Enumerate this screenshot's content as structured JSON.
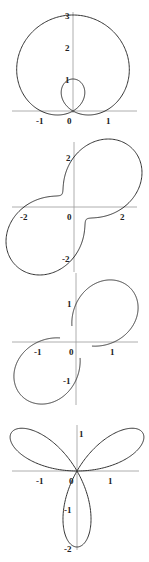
{
  "chart_data": [
    {
      "type": "line",
      "title": "",
      "description": "Polar curve: limacon with inner loop, r = 1 + 2 sin(theta)",
      "equation": "r = 1 + 2 sin(theta)",
      "origin_px": [
        73,
        111
      ],
      "unit_px": 32,
      "xlim": [
        -1.9,
        2.0
      ],
      "ylim": [
        -0.3,
        3.1
      ],
      "x_ticks": [
        {
          "value": -1,
          "label": "-1"
        },
        {
          "value": 0,
          "label": "0"
        },
        {
          "value": 1,
          "label": "1"
        }
      ],
      "y_ticks": [
        {
          "value": 1,
          "label": "1"
        },
        {
          "value": 2,
          "label": "2"
        },
        {
          "value": 3,
          "label": "3"
        }
      ],
      "grid": false
    },
    {
      "type": "line",
      "title": "",
      "description": "Polar curve: peanut-shaped curve elongated along y = x",
      "equation": "r = 2 + 1.3 sin(2 theta)",
      "origin_px": [
        74,
        207
      ],
      "unit_px": 25,
      "xlim": [
        -2.6,
        2.6
      ],
      "ylim": [
        -2.8,
        2.8
      ],
      "x_ticks": [
        {
          "value": -2,
          "label": "-2"
        },
        {
          "value": 0,
          "label": "0"
        },
        {
          "value": 2,
          "label": "2"
        }
      ],
      "y_ticks": [
        {
          "value": 2,
          "label": "2"
        },
        {
          "value": -2,
          "label": "-2"
        }
      ],
      "grid": false
    },
    {
      "type": "line",
      "title": "",
      "description": "Polar curve: two-petal curve with petals in quadrants I and III, passing through origin",
      "equation": "r = sin(theta) + cos(theta) + 0.6 sin(2 theta)",
      "origin_px": [
        76,
        342
      ],
      "unit_px": 38,
      "xlim": [
        -1.7,
        1.7
      ],
      "ylim": [
        -1.8,
        1.8
      ],
      "x_ticks": [
        {
          "value": -1,
          "label": "-1"
        },
        {
          "value": 0,
          "label": "0"
        },
        {
          "value": 1,
          "label": "1"
        }
      ],
      "y_ticks": [
        {
          "value": 1,
          "label": "1"
        },
        {
          "value": -1,
          "label": "-1"
        }
      ],
      "grid": false
    },
    {
      "type": "line",
      "title": "",
      "description": "Polar curve: three-petal rose",
      "equation": "r = 2 sin(3 theta)",
      "origin_px": [
        77,
        471
      ],
      "unit_px": 38,
      "xlim": [
        -1.9,
        1.9
      ],
      "ylim": [
        -2.1,
        1.4
      ],
      "x_ticks": [
        {
          "value": -1,
          "label": "-1"
        },
        {
          "value": 0,
          "label": "0"
        },
        {
          "value": 1,
          "label": "1"
        }
      ],
      "y_ticks": [
        {
          "value": 1,
          "label": "1"
        },
        {
          "value": -1,
          "label": "-1"
        },
        {
          "value": -2,
          "label": "-2"
        }
      ],
      "grid": false
    }
  ],
  "plots": [
    {
      "x_label_neg": "-1",
      "x_label_zero": "0",
      "x_label_pos": "1",
      "y_labels": [
        "1",
        "2",
        "3"
      ]
    },
    {
      "x_label_neg": "-2",
      "x_label_zero": "0",
      "x_label_pos": "2",
      "y_labels": [
        "2",
        "-2"
      ]
    },
    {
      "x_label_neg": "-1",
      "x_label_zero": "0",
      "x_label_pos": "1",
      "y_labels": [
        "1",
        "-1"
      ]
    },
    {
      "x_label_neg": "-1",
      "x_label_zero": "0",
      "x_label_pos": "1",
      "y_labels": [
        "1",
        "-1",
        "-2"
      ]
    }
  ]
}
